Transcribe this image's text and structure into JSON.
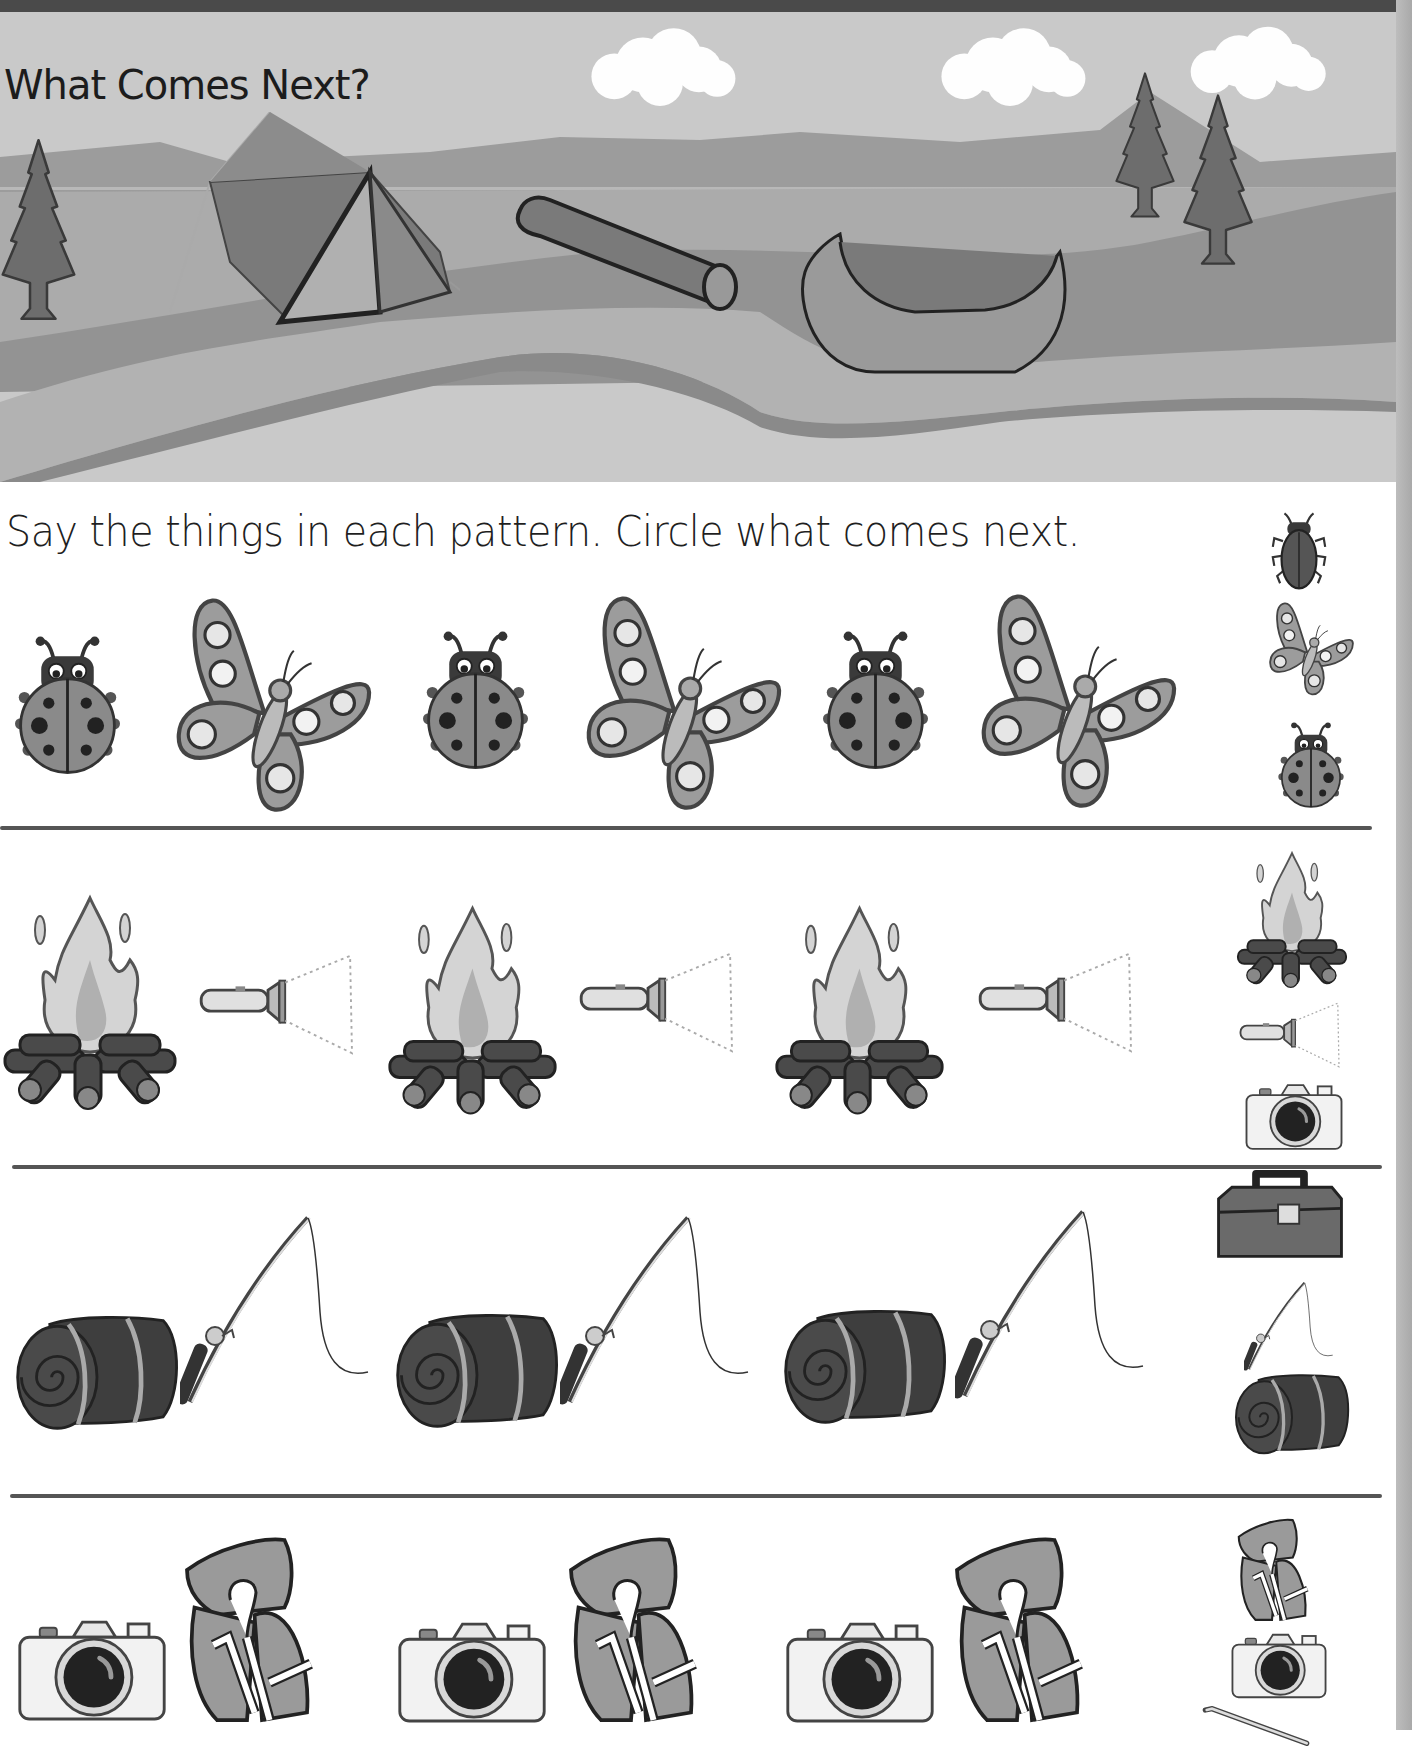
{
  "page": {
    "title": "What Comes Next?",
    "instructions": "Say the things in each pattern. Circle what comes next."
  },
  "scene": {
    "elements": [
      "pine-tree",
      "tent",
      "log",
      "canoe",
      "pine-tree",
      "pine-tree",
      "cloud",
      "cloud",
      "cloud",
      "mountains",
      "lake",
      "river"
    ]
  },
  "patterns": [
    {
      "row": 1,
      "sequence": [
        "ladybug",
        "butterfly",
        "ladybug",
        "butterfly",
        "ladybug",
        "butterfly"
      ],
      "choices": [
        "beetle",
        "butterfly",
        "ladybug"
      ]
    },
    {
      "row": 2,
      "sequence": [
        "campfire",
        "flashlight",
        "campfire",
        "flashlight",
        "campfire",
        "flashlight"
      ],
      "choices": [
        "campfire",
        "flashlight",
        "camera"
      ]
    },
    {
      "row": 3,
      "sequence": [
        "sleeping-bag",
        "fishing-rod",
        "sleeping-bag",
        "fishing-rod",
        "sleeping-bag",
        "fishing-rod"
      ],
      "choices": [
        "tackle-box",
        "fishing-rod",
        "sleeping-bag"
      ]
    },
    {
      "row": 4,
      "sequence": [
        "camera",
        "life-jacket",
        "camera",
        "life-jacket",
        "camera",
        "life-jacket"
      ],
      "choices": [
        "life-jacket",
        "camera",
        "paddle"
      ]
    }
  ],
  "colors": {
    "sky": "#c9c9c9",
    "mountains": "#9a9a9a",
    "lake": "#a8a8a8",
    "grass": "#8f8f8f",
    "river": "#b5b5b5",
    "ink": "#1c1c1c",
    "divider": "#555555"
  }
}
